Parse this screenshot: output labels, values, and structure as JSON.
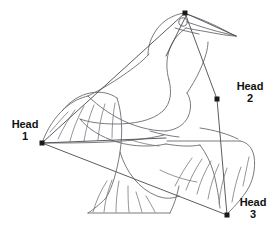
{
  "diagram": {
    "background_color": "#ffffff",
    "outline_color": "#6b6b70",
    "mesh_color": "#4a4a50",
    "vertex_color": "#1a1a1a",
    "label_color": "#111111",
    "width": 277,
    "height": 242
  },
  "labels": {
    "head1": {
      "name": "Head",
      "number": "1",
      "x": 42,
      "y": 143
    },
    "head2": {
      "name": "Head",
      "number": "2",
      "x": 217,
      "y": 99
    },
    "head3": {
      "name": "Head",
      "number": "3",
      "x": 227,
      "y": 215
    }
  },
  "vertices": [
    {
      "id": "apex",
      "x": 185,
      "y": 13,
      "labeled": false
    },
    {
      "id": "head1",
      "x": 42,
      "y": 143,
      "labeled": true
    },
    {
      "id": "head2",
      "x": 217,
      "y": 99,
      "labeled": true
    },
    {
      "id": "head3",
      "x": 227,
      "y": 215,
      "labeled": true
    }
  ],
  "icons": {
    "eye": "eye-circle-icon",
    "vertex": "vertex-point-icon"
  }
}
